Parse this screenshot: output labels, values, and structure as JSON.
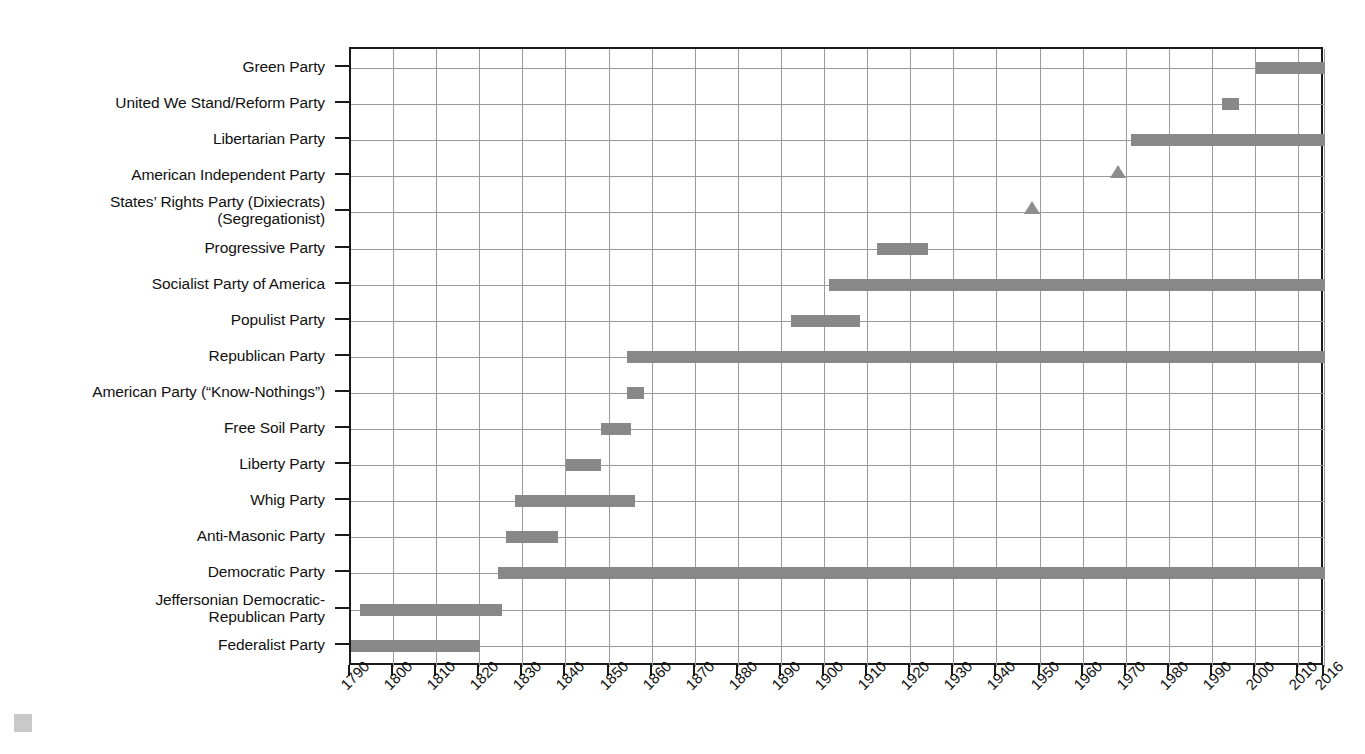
{
  "chart_data": {
    "type": "bar",
    "orientation": "horizontal-timeline",
    "title": "",
    "xlabel": "",
    "ylabel": "",
    "xlim": [
      1790,
      2016
    ],
    "grid": true,
    "legend": "none",
    "bar_color": "#888888",
    "marker_color": "#8d8d8d",
    "axis_color": "#1a1a1a",
    "grid_color": "#9a9a9a",
    "xticks": [
      "1790",
      "1800",
      "1810",
      "1820",
      "1830",
      "1840",
      "1850",
      "1860",
      "1870",
      "1880",
      "1890",
      "1900",
      "1910",
      "1920",
      "1930",
      "1940",
      "1950",
      "1960",
      "1970",
      "1980",
      "1990",
      "2000",
      "2010",
      "2016"
    ],
    "xtick_values": [
      1790,
      1800,
      1810,
      1820,
      1830,
      1840,
      1850,
      1860,
      1870,
      1880,
      1890,
      1900,
      1910,
      1920,
      1930,
      1940,
      1950,
      1960,
      1970,
      1980,
      1990,
      2000,
      2010,
      2016
    ],
    "categories": [
      "Green Party",
      "United We Stand/Reform Party",
      "Libertarian Party",
      "American Independent Party",
      "States’ Rights Party (Dixiecrats)\n(Segregationist)",
      "Progressive Party",
      "Socialist Party of America",
      "Populist Party",
      "Republican Party",
      "American Party (“Know-Nothings”)",
      "Free Soil Party",
      "Liberty Party",
      "Whig Party",
      "Anti-Masonic Party",
      "Democratic Party",
      "Jeffersonian Democratic-\nRepublican Party",
      "Federalist Party"
    ],
    "series": [
      {
        "name": "Green Party",
        "mark": "bar",
        "start": 2000,
        "end": 2016
      },
      {
        "name": "United We Stand/Reform Party",
        "mark": "bar",
        "start": 1992,
        "end": 1996
      },
      {
        "name": "Libertarian Party",
        "mark": "bar",
        "start": 1971,
        "end": 2016
      },
      {
        "name": "American Independent Party",
        "mark": "triangle",
        "start": 1968,
        "end": 1968
      },
      {
        "name": "States’ Rights Party (Dixiecrats) (Segregationist)",
        "mark": "triangle",
        "start": 1948,
        "end": 1948
      },
      {
        "name": "Progressive Party",
        "mark": "bar",
        "start": 1912,
        "end": 1924
      },
      {
        "name": "Socialist Party of America",
        "mark": "bar",
        "start": 1901,
        "end": 2016
      },
      {
        "name": "Populist Party",
        "mark": "bar",
        "start": 1892,
        "end": 1908
      },
      {
        "name": "Republican Party",
        "mark": "bar",
        "start": 1854,
        "end": 2016
      },
      {
        "name": "American Party (“Know-Nothings”)",
        "mark": "bar",
        "start": 1854,
        "end": 1858
      },
      {
        "name": "Free Soil Party",
        "mark": "bar",
        "start": 1848,
        "end": 1855
      },
      {
        "name": "Liberty Party",
        "mark": "bar",
        "start": 1840,
        "end": 1848
      },
      {
        "name": "Whig Party",
        "mark": "bar",
        "start": 1828,
        "end": 1856
      },
      {
        "name": "Anti-Masonic Party",
        "mark": "bar",
        "start": 1826,
        "end": 1838
      },
      {
        "name": "Democratic Party",
        "mark": "bar",
        "start": 1824,
        "end": 2016
      },
      {
        "name": "Jeffersonian Democratic-Republican Party",
        "mark": "bar",
        "start": 1792,
        "end": 1825
      },
      {
        "name": "Federalist Party",
        "mark": "bar",
        "start": 1790,
        "end": 1820
      }
    ]
  },
  "layout": {
    "plot_left": 349,
    "plot_right": 1323,
    "plot_top": 47,
    "plot_bottom": 665,
    "row_first_center": 66,
    "row_step": 36.1,
    "bar_height": 12
  }
}
